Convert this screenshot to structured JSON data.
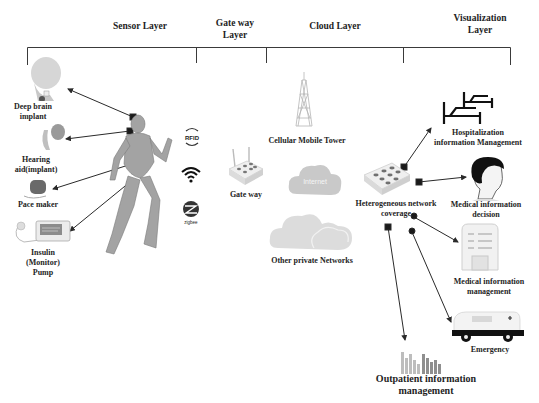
{
  "layers": [
    {
      "id": "sensor",
      "label": "Sensor Layer"
    },
    {
      "id": "gateway",
      "label": "Gate way Layer",
      "lines": [
        "Gate way",
        "Layer"
      ]
    },
    {
      "id": "cloud",
      "label": "Cloud Layer"
    },
    {
      "id": "visualization",
      "label": "Visualization Layer",
      "lines": [
        "Visualization",
        "Layer"
      ]
    }
  ],
  "sensor_layer": {
    "devices": [
      {
        "id": "deep-brain",
        "lines": [
          "Deep brain",
          "implant"
        ]
      },
      {
        "id": "hearing-aid",
        "lines": [
          "Hearing",
          "aid(implant)"
        ]
      },
      {
        "id": "pacemaker",
        "lines": [
          "Pace maker"
        ]
      },
      {
        "id": "insulin-pump",
        "lines": [
          "Insulin",
          "(Monitor)",
          "Pump"
        ]
      }
    ],
    "wireless": [
      {
        "id": "rfid",
        "label": "RFID"
      },
      {
        "id": "wifi",
        "label": ""
      },
      {
        "id": "zigbee",
        "label": "zigbee"
      }
    ]
  },
  "gateway_layer": {
    "node": {
      "label": "Gate way"
    }
  },
  "cloud_layer": {
    "tower": {
      "label": "Cellular Mobile Tower"
    },
    "internet": {
      "label": "Internet"
    },
    "private": {
      "label": "Other private Networks"
    },
    "coverage": {
      "lines": [
        "Heterogeneous network",
        "coverage"
      ]
    }
  },
  "visualization_layer": {
    "items": [
      {
        "id": "hospitalization",
        "lines": [
          "Hospitalization",
          "information Management"
        ]
      },
      {
        "id": "decision",
        "lines": [
          "Medical information",
          "decision"
        ]
      },
      {
        "id": "management",
        "lines": [
          "Medical information",
          "management"
        ]
      },
      {
        "id": "emergency",
        "lines": [
          "Emergency"
        ]
      },
      {
        "id": "outpatient",
        "lines": [
          "Outpatient information",
          "management"
        ]
      }
    ]
  },
  "colors": {
    "line": "#2a2a2a",
    "cloud": "#cfcfcf",
    "cloud_light": "#dedede",
    "device": "#e9e9e9",
    "body": "#a8a8a8"
  }
}
